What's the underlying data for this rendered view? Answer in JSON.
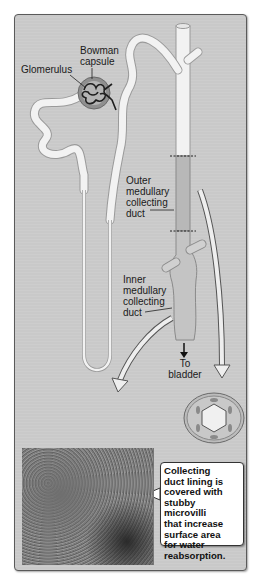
{
  "figure": {
    "colors": {
      "panel_background": "#c9c9c9",
      "tubule_fill": "#f2f2f2",
      "tubule_outline": "#9a9a9a",
      "collecting_duct_fill": "#bdbdbd",
      "capsule_fill": "#8f8f8f",
      "glomerulus_stroke": "#1f1f1f",
      "callout_background": "#ffffff"
    }
  },
  "labels": {
    "bowman_line1": "Bowman",
    "bowman_line2": "capsule",
    "glomerulus": "Glomerulus",
    "outer_line1": "Outer",
    "outer_line2": "medullary",
    "outer_line3": "collecting",
    "outer_line4": "duct",
    "inner_line1": "Inner",
    "inner_line2": "medullary",
    "inner_line3": "collecting",
    "inner_line4": "duct",
    "bladder_line1": "To",
    "bladder_line2": "bladder"
  },
  "callout": {
    "lines": [
      "Collecting",
      "duct lining is",
      "covered with",
      "stubby microvilli",
      "that increase",
      "surface area",
      "for water",
      "reabsorption."
    ]
  },
  "insets": {
    "micrograph": "scanning electron micrograph of collecting duct lining",
    "cross_section": "collecting duct cross-section (cuboidal cells ring)"
  }
}
